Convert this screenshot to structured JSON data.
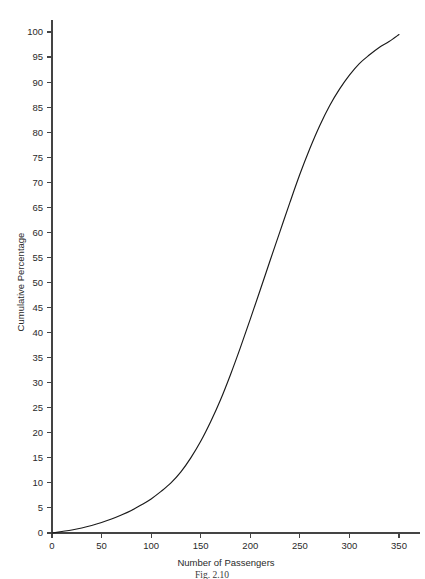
{
  "chart_data": {
    "type": "line",
    "title": "",
    "xlabel": "Number of Passengers",
    "ylabel": "Cumulative Percentage",
    "xlim": [
      0,
      375
    ],
    "ylim": [
      0,
      102
    ],
    "grid": false,
    "legend": null,
    "xticks": [
      0,
      50,
      100,
      150,
      200,
      250,
      300,
      350
    ],
    "yticks": [
      0,
      5,
      10,
      15,
      20,
      25,
      30,
      35,
      40,
      45,
      50,
      55,
      60,
      65,
      70,
      75,
      80,
      85,
      90,
      95,
      100
    ],
    "series": [
      {
        "name": "Cumulative Percentage",
        "x": [
          0,
          10,
          20,
          30,
          40,
          50,
          60,
          70,
          80,
          90,
          100,
          110,
          120,
          130,
          140,
          150,
          160,
          170,
          180,
          190,
          200,
          210,
          220,
          230,
          240,
          250,
          260,
          270,
          280,
          290,
          300,
          310,
          320,
          330,
          340,
          350
        ],
        "values": [
          0.0,
          0.3,
          0.6,
          1.0,
          1.5,
          2.1,
          2.8,
          3.6,
          4.5,
          5.6,
          6.8,
          8.3,
          10.0,
          12.2,
          15.0,
          18.3,
          22.2,
          26.6,
          31.6,
          37.0,
          42.7,
          48.5,
          54.4,
          60.2,
          66.0,
          71.6,
          76.7,
          81.3,
          85.3,
          88.6,
          91.4,
          93.7,
          95.4,
          96.9,
          98.1,
          99.5
        ]
      }
    ]
  },
  "axes": {
    "y_axis_title": "Cumulative Percentage",
    "x_axis_title": "Number of Passengers",
    "y_tick_labels": [
      "0",
      "5",
      "10",
      "15",
      "20",
      "25",
      "30",
      "35",
      "40",
      "45",
      "50",
      "55",
      "60",
      "65",
      "70",
      "75",
      "80",
      "85",
      "90",
      "95",
      "100"
    ],
    "x_tick_labels": [
      "0",
      "50",
      "100",
      "150",
      "200",
      "250",
      "300",
      "350"
    ]
  },
  "caption": {
    "text": "Fig. 2.10"
  },
  "colors": {
    "curve": "#1a1a1a",
    "axis": "#444444",
    "text": "#2a2a2a",
    "background": "#ffffff"
  }
}
